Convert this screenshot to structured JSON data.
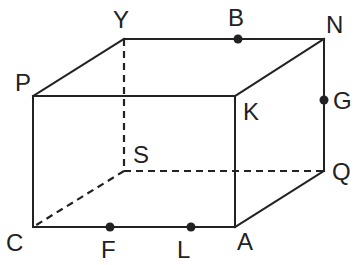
{
  "diagram": {
    "type": "rectangular-prism",
    "vertices": {
      "Y": {
        "label": "Y",
        "x": 124,
        "y": 39
      },
      "N": {
        "label": "N",
        "x": 324,
        "y": 39
      },
      "P": {
        "label": "P",
        "x": 33,
        "y": 96
      },
      "K": {
        "label": "K",
        "x": 235,
        "y": 96
      },
      "S": {
        "label": "S",
        "x": 124,
        "y": 171
      },
      "Q": {
        "label": "Q",
        "x": 324,
        "y": 171
      },
      "C": {
        "label": "C",
        "x": 33,
        "y": 227
      },
      "A": {
        "label": "A",
        "x": 235,
        "y": 227
      }
    },
    "points_on_edges": {
      "B": {
        "label": "B",
        "edge": "YN"
      },
      "G": {
        "label": "G",
        "edge": "NQ"
      },
      "F": {
        "label": "F",
        "edge": "CA"
      },
      "L": {
        "label": "L",
        "edge": "CA"
      }
    },
    "visible_edges": [
      "PY",
      "YN",
      "NK",
      "PK",
      "PC",
      "CA",
      "KA",
      "NQ",
      "QA"
    ],
    "hidden_edges": [
      "YS",
      "SC",
      "SQ"
    ],
    "line_color": "#222222"
  }
}
